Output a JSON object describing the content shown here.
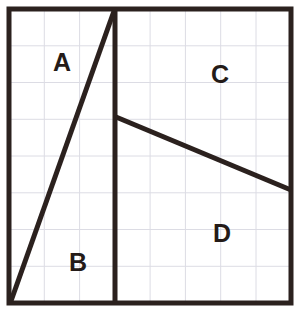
{
  "figure": {
    "canvas": {
      "width": 299,
      "height": 321
    },
    "colors": {
      "background": "#ffffff",
      "ink": "#2b211e",
      "grid": "#dcdce4",
      "label": "#241b18"
    },
    "border": {
      "name": "outer-square",
      "left": 9,
      "top": 9,
      "right": 291,
      "bottom": 303,
      "stroke_width": 5
    },
    "grid": {
      "columns": 8,
      "rows": 8,
      "stroke_width": 1,
      "x_lines": [
        44.3,
        79.6,
        114.9,
        150.1,
        185.4,
        220.7,
        256.0
      ],
      "y_lines": [
        45.8,
        82.5,
        119.3,
        156.0,
        192.8,
        229.5,
        266.3
      ]
    },
    "segments": [
      {
        "name": "vertical-divider",
        "x1": 115,
        "y1": 9,
        "x2": 115,
        "y2": 303,
        "stroke_width": 5
      },
      {
        "name": "left-diagonal",
        "x1": 11,
        "y1": 301,
        "x2": 114,
        "y2": 11,
        "stroke_width": 5
      },
      {
        "name": "right-diagonal",
        "x1": 116,
        "y1": 117,
        "x2": 291,
        "y2": 190,
        "stroke_width": 5
      }
    ],
    "labels": [
      {
        "name": "region-label-a",
        "text": "A",
        "x": 62,
        "y": 62
      },
      {
        "name": "region-label-b",
        "text": "B",
        "x": 78,
        "y": 262
      },
      {
        "name": "region-label-c",
        "text": "C",
        "x": 220,
        "y": 74
      },
      {
        "name": "region-label-d",
        "text": "D",
        "x": 222,
        "y": 233
      }
    ]
  }
}
